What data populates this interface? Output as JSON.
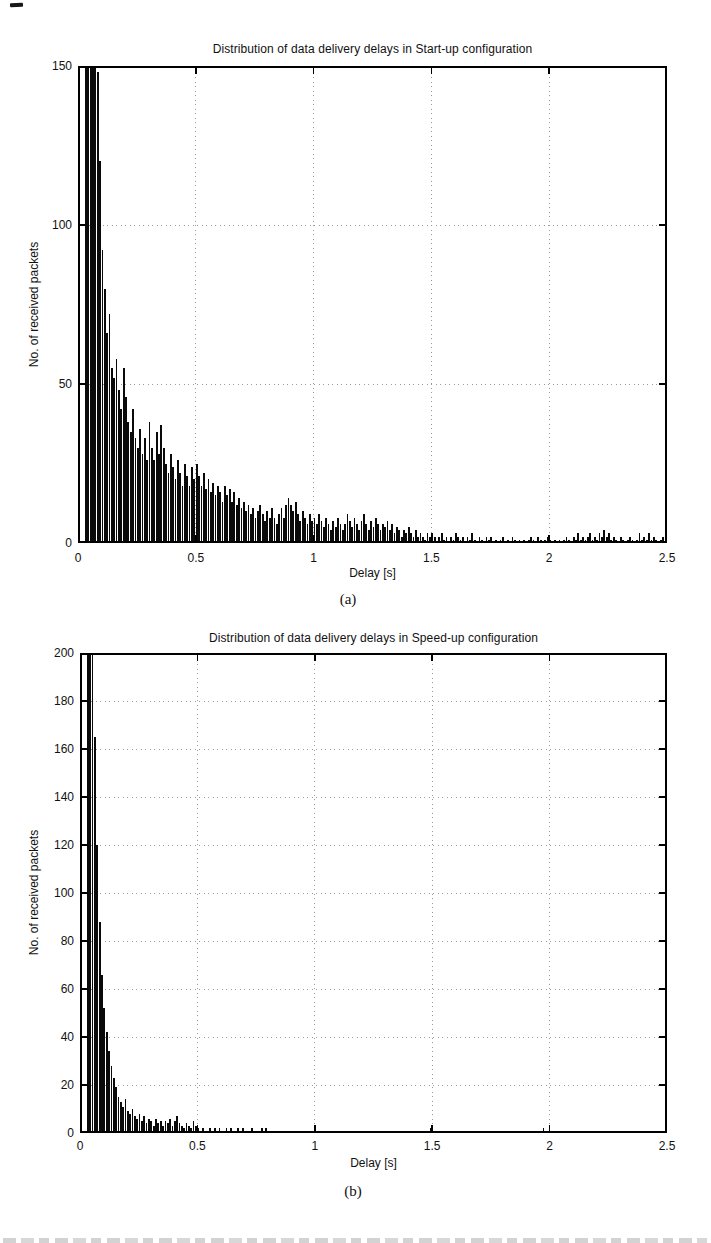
{
  "figure": {
    "corner_mark": true,
    "caption_fragment_visible": true
  },
  "chart_data": [
    {
      "type": "bar",
      "title": "Distribution of data delivery delays in Start-up configuration",
      "xlabel": "Delay [s]",
      "ylabel": "No. of received packets",
      "panel_label": "(a)",
      "xlim": [
        0,
        2.5
      ],
      "ylim": [
        0,
        150
      ],
      "xticks": [
        0,
        0.5,
        1,
        1.5,
        2,
        2.5
      ],
      "xtick_labels": [
        "0",
        "0.5",
        "1",
        "1.5",
        "2",
        "2.5"
      ],
      "yticks": [
        0,
        50,
        100,
        150
      ],
      "ytick_labels": [
        "0",
        "50",
        "100",
        "150"
      ],
      "grid": "dotted",
      "legend": "none",
      "bar_color": "#0a0a0a",
      "grid_color": "#9a9a9a",
      "axis_color": "#000000",
      "bin_width": 0.01,
      "bin_start": 0,
      "values": [
        0,
        0,
        0,
        150,
        150,
        150,
        150,
        150,
        148,
        120,
        92,
        80,
        66,
        72,
        55,
        52,
        58,
        48,
        42,
        55,
        46,
        38,
        35,
        42,
        33,
        30,
        36,
        28,
        33,
        26,
        38,
        30,
        26,
        35,
        28,
        37,
        30,
        25,
        22,
        28,
        24,
        20,
        26,
        22,
        18,
        25,
        21,
        18,
        24,
        20,
        25,
        21,
        18,
        22,
        17,
        20,
        16,
        19,
        15,
        18,
        16,
        13,
        18,
        15,
        17,
        13,
        16,
        12,
        14,
        11,
        13,
        10,
        12,
        9,
        11,
        8,
        10,
        12,
        9,
        7,
        10,
        8,
        11,
        8,
        6,
        9,
        11,
        8,
        12,
        14,
        12,
        10,
        13,
        9,
        7,
        10,
        8,
        6,
        9,
        7,
        8,
        6,
        9,
        7,
        5,
        8,
        6,
        4,
        7,
        5,
        8,
        6,
        4,
        6,
        9,
        7,
        5,
        8,
        6,
        4,
        7,
        9,
        6,
        4,
        7,
        5,
        8,
        6,
        4,
        6,
        5,
        7,
        4,
        6,
        3,
        5,
        4,
        2,
        4,
        3,
        5,
        3,
        2,
        4,
        2,
        3,
        2,
        1,
        3,
        2,
        3,
        2,
        0,
        2,
        3,
        1,
        2,
        0,
        2,
        1,
        3,
        2,
        1,
        2,
        0,
        2,
        1,
        3,
        1,
        0,
        2,
        1,
        0,
        2,
        1,
        2,
        0,
        1,
        0,
        1,
        2,
        0,
        1,
        0,
        2,
        1,
        0,
        1,
        0,
        1,
        0,
        1,
        2,
        1,
        0,
        2,
        1,
        0,
        1,
        2,
        1,
        0,
        1,
        0,
        1,
        0,
        1,
        2,
        1,
        0,
        2,
        1,
        3,
        1,
        2,
        1,
        2,
        3,
        1,
        2,
        1,
        3,
        2,
        4,
        2,
        3,
        1,
        2,
        1,
        0,
        2,
        1,
        0,
        1,
        2,
        1,
        0,
        1,
        3,
        1,
        2,
        1,
        3,
        1,
        2,
        1,
        0,
        1,
        2,
        1
      ]
    },
    {
      "type": "bar",
      "title": "Distribution of data delivery delays in Speed-up configuration",
      "xlabel": "Delay [s]",
      "ylabel": "No. of received packets",
      "panel_label": "(b)",
      "xlim": [
        0,
        2.5
      ],
      "ylim": [
        0,
        200
      ],
      "xticks": [
        0,
        0.5,
        1,
        1.5,
        2,
        2.5
      ],
      "xtick_labels": [
        "0",
        "0.5",
        "1",
        "1.5",
        "2",
        "2.5"
      ],
      "yticks": [
        0,
        20,
        40,
        60,
        80,
        100,
        120,
        140,
        160,
        180,
        200
      ],
      "ytick_labels": [
        "0",
        "20",
        "40",
        "60",
        "80",
        "100",
        "120",
        "140",
        "160",
        "180",
        "200"
      ],
      "grid": "dotted",
      "legend": "none",
      "bar_color": "#0a0a0a",
      "grid_color": "#9a9a9a",
      "axis_color": "#000000",
      "bin_width": 0.01,
      "bin_start": 0,
      "values": [
        0,
        0,
        0,
        200,
        200,
        200,
        165,
        120,
        88,
        66,
        52,
        42,
        34,
        28,
        23,
        19,
        15,
        13,
        11,
        14,
        9,
        8,
        10,
        7,
        6,
        8,
        5,
        7,
        4,
        6,
        5,
        3,
        6,
        4,
        5,
        3,
        5,
        4,
        6,
        3,
        5,
        7,
        4,
        3,
        2,
        4,
        3,
        2,
        5,
        3,
        2,
        1,
        2,
        0,
        1,
        2,
        1,
        2,
        1,
        2,
        1,
        0,
        2,
        1,
        2,
        1,
        0,
        2,
        1,
        2,
        1,
        0,
        1,
        2,
        1,
        0,
        1,
        2,
        1,
        2,
        1,
        0,
        0,
        0,
        0,
        0,
        0,
        0,
        0,
        0,
        0,
        0,
        0,
        0,
        0,
        0,
        0,
        0,
        0,
        0,
        0,
        0,
        0,
        0,
        0,
        1,
        1,
        1,
        0,
        0,
        0,
        0,
        0,
        0,
        0,
        0,
        0,
        0,
        0,
        0,
        0,
        0,
        0,
        0,
        0,
        0,
        0,
        0,
        0,
        0,
        0,
        0,
        0,
        0,
        0,
        0,
        0,
        0,
        0,
        0,
        0,
        0,
        0,
        0,
        0,
        0,
        1,
        0,
        0,
        2,
        1,
        0,
        0,
        0,
        0,
        0,
        0,
        0,
        0,
        1,
        1,
        0,
        0,
        0,
        0,
        0,
        0,
        0,
        0,
        0,
        0,
        0,
        0,
        0,
        0,
        0,
        0,
        0,
        0,
        0,
        0,
        0,
        0,
        0,
        0,
        0,
        0,
        0,
        0,
        0,
        0,
        0,
        0,
        0,
        0,
        1,
        0,
        2,
        0,
        0,
        0,
        1,
        1,
        0,
        0,
        0,
        0,
        0,
        0,
        0,
        0,
        0,
        0,
        0,
        0,
        0,
        0,
        0,
        0,
        0,
        0,
        0,
        0,
        0,
        0,
        0,
        0,
        0,
        0,
        0,
        0,
        0,
        0,
        0,
        0,
        0,
        0,
        0,
        0,
        0,
        0,
        0,
        0,
        0,
        0,
        0,
        1,
        0,
        1,
        1
      ]
    }
  ]
}
